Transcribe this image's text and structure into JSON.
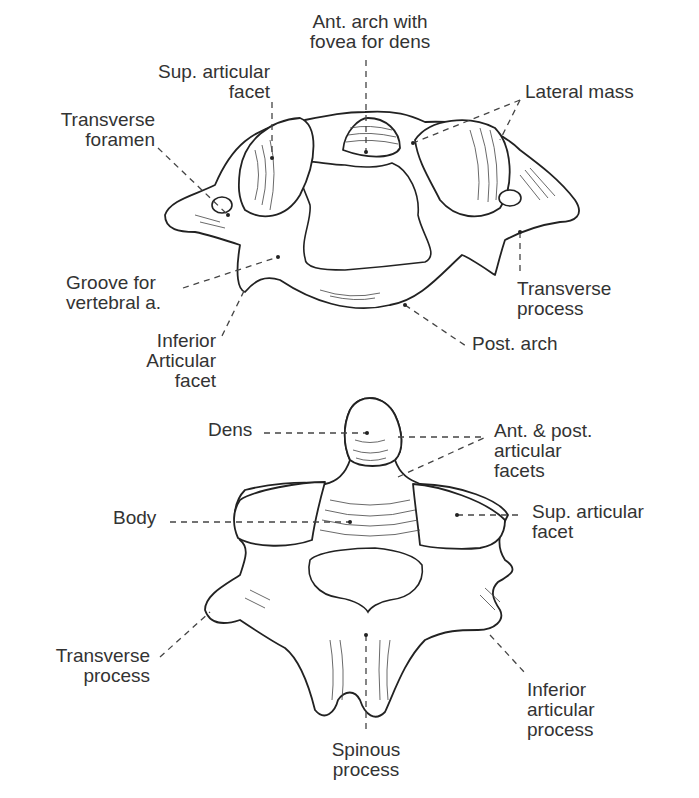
{
  "figure": {
    "atlas": {
      "labels": {
        "ant_arch": [
          "Ant. arch with",
          "fovea for dens"
        ],
        "sup_articular_facet": [
          "Sup. articular",
          "facet"
        ],
        "lateral_mass": [
          "Lateral mass"
        ],
        "transverse_foramen": [
          "Transverse",
          "foramen"
        ],
        "groove_vertebral": [
          "Groove for",
          "vertebral a."
        ],
        "transverse_process": [
          "Transverse",
          "process"
        ],
        "inferior_articular_facet": [
          "Inferior",
          "Articular",
          "facet"
        ],
        "post_arch": [
          "Post. arch"
        ]
      }
    },
    "axis": {
      "labels": {
        "dens": [
          "Dens"
        ],
        "ant_post_facets": [
          "Ant. & post.",
          "articular",
          "facets"
        ],
        "body": [
          "Body"
        ],
        "sup_articular_facet": [
          "Sup. articular",
          "facet"
        ],
        "transverse_process": [
          "Transverse",
          "process"
        ],
        "inferior_articular_process": [
          "Inferior",
          "articular",
          "process"
        ],
        "spinous_process": [
          "Spinous",
          "process"
        ]
      }
    }
  }
}
